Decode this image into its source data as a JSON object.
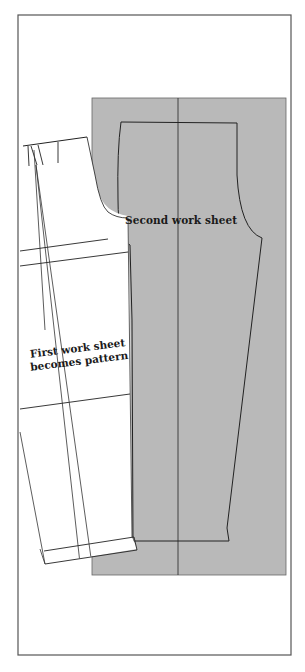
{
  "figure": {
    "type": "pattern-drafting-diagram",
    "colors": {
      "background": "#ffffff",
      "frame": "#555555",
      "second_sheet_fill": "#b9b9b9",
      "outline": "#222222",
      "first_sheet_fill": "#ffffff"
    },
    "labels": {
      "second_work_sheet": "Second work sheet",
      "first_work_sheet_line1": "First work sheet",
      "first_work_sheet_line2": "becomes pattern"
    }
  }
}
